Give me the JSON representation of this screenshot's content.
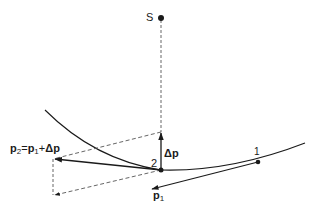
{
  "diagram": {
    "type": "vector-momentum-diagram",
    "colors": {
      "stroke": "#1a1a1a",
      "background": "#ffffff"
    },
    "points": {
      "S": {
        "label": "S",
        "x": 161,
        "y": 18
      },
      "p2_point": {
        "label": "2",
        "x": 161,
        "y": 170
      },
      "p1_point": {
        "label": "1",
        "x": 258,
        "y": 162
      }
    },
    "labels": {
      "S": "S",
      "point1": "1",
      "point2": "2",
      "delta_p": "Δp",
      "p1_main": "p",
      "p1_sub": "1",
      "equation": {
        "p2": "p",
        "p2_sub": "2",
        "eq": "=",
        "p1": "p",
        "p1_sub": "1",
        "plus": "+",
        "dp": "Δp"
      }
    },
    "vectors": [
      {
        "name": "p1",
        "from": [
          258,
          162
        ],
        "to": [
          151,
          189
        ],
        "style": "solid"
      },
      {
        "name": "p2",
        "from": [
          161,
          170
        ],
        "to": [
          53,
          159
        ],
        "style": "solid"
      },
      {
        "name": "delta-p",
        "from": [
          161,
          170
        ],
        "to": [
          161,
          132
        ],
        "style": "solid"
      },
      {
        "name": "p1-copy",
        "from": [
          161,
          170
        ],
        "to": [
          53,
          195
        ],
        "style": "dashed"
      }
    ],
    "construction_lines": [
      {
        "name": "S-to-2",
        "from": [
          161,
          18
        ],
        "to": [
          161,
          132
        ],
        "style": "dashed"
      },
      {
        "name": "dp-to-p2",
        "from": [
          161,
          132
        ],
        "to": [
          53,
          159
        ],
        "style": "dashed"
      },
      {
        "name": "p2-to-corner",
        "from": [
          53,
          159
        ],
        "to": [
          53,
          195
        ],
        "style": "dashed"
      }
    ],
    "orbit_curve": {
      "start": [
        45,
        110
      ],
      "through": [
        161,
        170
      ],
      "end": [
        305,
        143
      ]
    }
  }
}
